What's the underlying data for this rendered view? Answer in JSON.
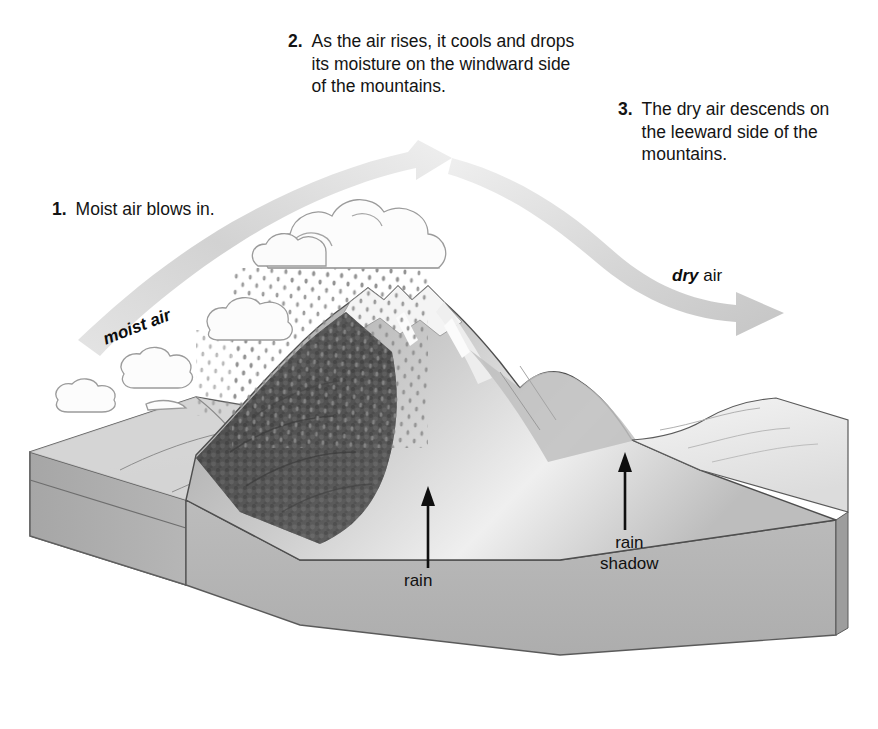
{
  "diagram": {
    "callouts": [
      {
        "number": "1.",
        "text": "Moist air blows in."
      },
      {
        "number": "2.",
        "text": "As the air rises, it cools and drops its moisture on the windward side of the mountains."
      },
      {
        "number": "3.",
        "text": "The dry air descends on the leeward side of the mountains."
      }
    ],
    "flow_labels": {
      "moist_air": "moist air",
      "dry_air_emphasis": "dry",
      "dry_air_rest": " air"
    },
    "site_labels": {
      "rain": "rain",
      "rain_shadow_line1": "rain",
      "rain_shadow_line2": "shadow"
    },
    "colors": {
      "background": "#ffffff",
      "text": "#141414",
      "arrow_band": "#d4d4d4",
      "block_top": "#c9c9c9",
      "block_front": "#b4b4b4",
      "block_side": "#a8a8a8",
      "block_stratum": "#bdbdbd",
      "forest_dark": "#4a4a4a",
      "snow": "#f2f2f2",
      "mountain_rock": "#b9b9b9",
      "leeward_pale": "#e6e6e6",
      "cloud_outline": "#8c8c8c",
      "rain_dots": "#7a7a7a"
    }
  }
}
